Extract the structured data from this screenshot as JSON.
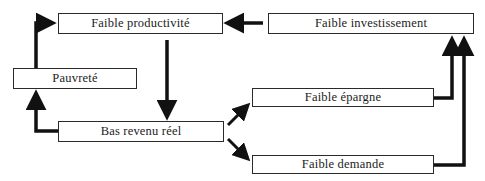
{
  "diagram": {
    "type": "flow-cycle",
    "nodes": [
      {
        "id": "productivite",
        "label": "Faible productivité"
      },
      {
        "id": "investissement",
        "label": "Faible investissement"
      },
      {
        "id": "pauvrete",
        "label": "Pauvreté"
      },
      {
        "id": "epargne",
        "label": "Faible épargne"
      },
      {
        "id": "revenu",
        "label": "Bas revenu réel"
      },
      {
        "id": "demande",
        "label": "Faible demande"
      }
    ],
    "edges": [
      {
        "from": "investissement",
        "to": "productivite"
      },
      {
        "from": "productivite",
        "to": "revenu"
      },
      {
        "from": "revenu",
        "to": "pauvrete"
      },
      {
        "from": "pauvrete",
        "to": "productivite"
      },
      {
        "from": "revenu",
        "to": "epargne"
      },
      {
        "from": "revenu",
        "to": "demande"
      },
      {
        "from": "epargne",
        "to": "investissement"
      },
      {
        "from": "demande",
        "to": "investissement"
      }
    ],
    "colors": {
      "line": "#111111",
      "border": "#2a2a2a",
      "text": "#222222"
    }
  }
}
